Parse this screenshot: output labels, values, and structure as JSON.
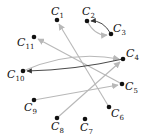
{
  "colors": {
    "node": "#111111",
    "edge_light": "#b8b8b8",
    "edge_dark": "#333333"
  },
  "nodes": [
    {
      "id": "C1",
      "base": "C",
      "sub": "1",
      "x": 57,
      "y": 20,
      "lx": 51,
      "ly": 15
    },
    {
      "id": "C2",
      "base": "C",
      "sub": "2",
      "x": 87,
      "y": 21,
      "lx": 82,
      "ly": 15
    },
    {
      "id": "C3",
      "base": "C",
      "sub": "3",
      "x": 111,
      "y": 34,
      "lx": 113,
      "ly": 32
    },
    {
      "id": "C11",
      "base": "C",
      "sub": "11",
      "x": 34,
      "y": 37,
      "lx": 17,
      "ly": 46
    },
    {
      "id": "C4",
      "base": "C",
      "sub": "4",
      "x": 123,
      "y": 59,
      "lx": 126,
      "ly": 57
    },
    {
      "id": "C10",
      "base": "C",
      "sub": "10",
      "x": 23,
      "y": 71,
      "lx": 7,
      "ly": 78
    },
    {
      "id": "C5",
      "base": "C",
      "sub": "5",
      "x": 122,
      "y": 84,
      "lx": 125,
      "ly": 90
    },
    {
      "id": "C9",
      "base": "C",
      "sub": "9",
      "x": 34,
      "y": 100,
      "lx": 24,
      "ly": 111
    },
    {
      "id": "C6",
      "base": "C",
      "sub": "6",
      "x": 109,
      "y": 107,
      "lx": 111,
      "ly": 117
    },
    {
      "id": "C8",
      "base": "C",
      "sub": "8",
      "x": 57,
      "y": 118,
      "lx": 51,
      "ly": 130
    },
    {
      "id": "C7",
      "base": "C",
      "sub": "7",
      "x": 85,
      "y": 119,
      "lx": 80,
      "ly": 131
    }
  ],
  "edges": [
    {
      "from": "C6",
      "to": "C1",
      "style": "light",
      "path": "M109,107 L59,24"
    },
    {
      "from": "C5",
      "to": "C11",
      "style": "light",
      "path": "M122,84 L38,39"
    },
    {
      "from": "C9",
      "to": "C5",
      "style": "light",
      "path": "M34,100 L118,85"
    },
    {
      "from": "C8",
      "to": "C4",
      "style": "light",
      "path": "M57,118 L120,62"
    },
    {
      "from": "C10",
      "to": "C4",
      "style": "light",
      "path": "M23,71 Q70,50 119,59"
    },
    {
      "from": "C4",
      "to": "C10",
      "style": "dark",
      "path": "M123,59 Q75,70 27,71"
    },
    {
      "from": "C2",
      "to": "C3",
      "style": "light",
      "path": "M87,21 Q95,36 107,35"
    },
    {
      "from": "C3",
      "to": "C2",
      "style": "dark",
      "path": "M111,34 Q103,20 91,21"
    }
  ]
}
